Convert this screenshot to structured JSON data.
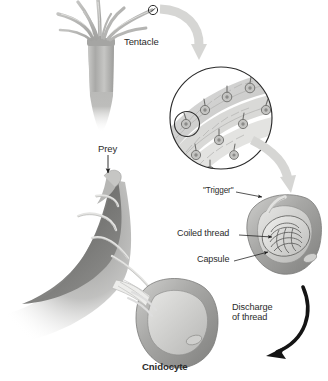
{
  "diagram": {
    "type": "biological-illustration",
    "palette": {
      "background": "#ffffff",
      "text": "#2b2b2b",
      "organism_light": "#d8d8d6",
      "organism_mid": "#b4b4b2",
      "organism_dark": "#8d8d8b",
      "prey_dark": "#6f6f6f",
      "flow_arrow": "#d6d6d4",
      "black_arrow": "#141414",
      "outline": "#2b2b2b"
    },
    "labels": {
      "tentacle": "Tentacle",
      "prey": "Prey",
      "trigger": "\"Trigger\"",
      "coiled_thread": "Coiled thread",
      "capsule": "Capsule",
      "discharge_line1": "Discharge",
      "discharge_line2": "of thread",
      "cnidocyte": "Cnidocyte"
    },
    "parts": [
      {
        "name": "sea-anemone",
        "description": "Cnidarian with crown of tentacles and columnar body, top-left"
      },
      {
        "name": "tentacle-tip-marker",
        "description": "Small circle marking a point on one tentacle tip"
      },
      {
        "name": "magnified-circle",
        "description": "Circular inset showing tentacle surface lined with cnidocytes"
      },
      {
        "name": "inner-circle-marker",
        "description": "Small circle inside the inset highlighting a single cnidocyte"
      },
      {
        "name": "undischarged-cnidocyte",
        "description": "Cell containing capsule with coiled thread and external trigger"
      },
      {
        "name": "discharged-cnidocyte",
        "description": "Cell after firing, thread everted and extended"
      },
      {
        "name": "prey",
        "description": "Dark prey organism wrapped by the discharged thread"
      }
    ],
    "flow_arrows": [
      {
        "name": "arrow-tentacle-to-inset",
        "style": "gray-curved",
        "from": "tentacle-tip",
        "to": "magnified-circle"
      },
      {
        "name": "arrow-inset-to-cnidocyte",
        "style": "gray-curved",
        "from": "magnified-circle",
        "to": "undischarged-cnidocyte"
      },
      {
        "name": "arrow-discharge",
        "style": "black-curved",
        "from": "undischarged-cnidocyte",
        "to": "discharged-cnidocyte"
      },
      {
        "name": "arrow-prey-pointer",
        "style": "thin-black-straight",
        "from": "prey-label",
        "to": "prey"
      }
    ]
  }
}
